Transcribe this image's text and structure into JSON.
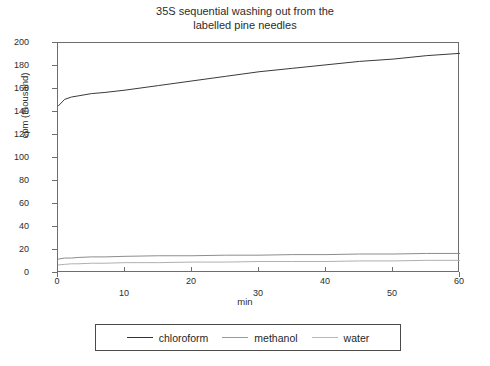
{
  "chart_data": {
    "type": "line",
    "title": "35S sequential washing out from the\nlabelled pine needles",
    "xlabel": "min",
    "ylabel": "cpm (thousand)",
    "xlim": [
      0,
      60
    ],
    "ylim": [
      0,
      200
    ],
    "xticks": [
      0,
      10,
      20,
      30,
      40,
      50,
      60
    ],
    "xtick_labels": [
      "0",
      "10",
      "20",
      "30",
      "40",
      "50",
      "60"
    ],
    "yticks": [
      0,
      20,
      40,
      60,
      80,
      100,
      120,
      140,
      160,
      180,
      200
    ],
    "ytick_labels": [
      "0",
      "20",
      "40",
      "60",
      "80",
      "100",
      "120",
      "140",
      "160",
      "180",
      "200"
    ],
    "grid": false,
    "legend_position": "below-plot",
    "legend_entries": [
      "chloroform",
      "methanol",
      "water"
    ],
    "x": [
      0,
      1,
      2,
      3,
      5,
      7,
      10,
      15,
      20,
      25,
      30,
      35,
      40,
      45,
      50,
      55,
      60
    ],
    "series": [
      {
        "name": "chloroform",
        "color": "#3a3a3a",
        "values": [
          145,
          151,
          153,
          154,
          156,
          157,
          159,
          163,
          167,
          171,
          175,
          178,
          181,
          184,
          186,
          189,
          191
        ]
      },
      {
        "name": "methanol",
        "color": "#8d8d8d",
        "values": [
          12,
          13,
          13,
          13.5,
          14,
          14,
          14.5,
          15,
          15,
          15.5,
          15.5,
          16,
          16,
          16.5,
          16.5,
          17,
          17
        ]
      },
      {
        "name": "water",
        "color": "#b0b0b0",
        "values": [
          7,
          7.5,
          8,
          8,
          8.5,
          8.5,
          9,
          9,
          9.5,
          9.5,
          10,
          10,
          10,
          10.5,
          10.5,
          11,
          11
        ]
      }
    ]
  }
}
